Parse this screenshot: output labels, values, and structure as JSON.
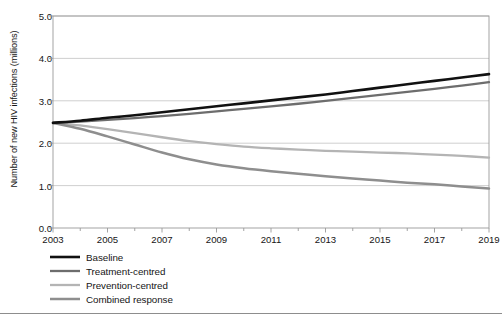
{
  "chart_data": {
    "type": "line",
    "title": "",
    "xlabel": "",
    "ylabel": "Number of new HIV infections (millions)",
    "xlim": [
      2003,
      2019
    ],
    "ylim": [
      0.0,
      5.0
    ],
    "grid": true,
    "legend_position": "below-axes-left",
    "x": [
      2003,
      2004,
      2005,
      2006,
      2007,
      2008,
      2009,
      2010,
      2011,
      2012,
      2013,
      2014,
      2015,
      2016,
      2017,
      2018,
      2019
    ],
    "ytick_labels": [
      "0.0",
      "1.0",
      "2.0",
      "3.0",
      "4.0",
      "5.0"
    ],
    "ytick_values": [
      0.0,
      1.0,
      2.0,
      3.0,
      4.0,
      5.0
    ],
    "xtick_labels": [
      "2003",
      "2005",
      "2007",
      "2009",
      "2011",
      "2013",
      "2015",
      "2017",
      "2019"
    ],
    "xtick_values": [
      2003,
      2005,
      2007,
      2009,
      2011,
      2013,
      2015,
      2017,
      2019
    ],
    "minor_xticks": [
      2004,
      2006,
      2008,
      2010,
      2012,
      2014,
      2016,
      2018
    ],
    "series": [
      {
        "name": "Baseline",
        "color": "#111111",
        "width": 2.6,
        "values": [
          2.48,
          2.53,
          2.6,
          2.66,
          2.73,
          2.8,
          2.87,
          2.94,
          3.01,
          3.08,
          3.15,
          3.23,
          3.31,
          3.39,
          3.47,
          3.55,
          3.63
        ]
      },
      {
        "name": "Treatment-centred",
        "color": "#6d6d6d",
        "width": 2.3,
        "values": [
          2.48,
          2.51,
          2.55,
          2.59,
          2.64,
          2.69,
          2.75,
          2.81,
          2.87,
          2.93,
          3.0,
          3.07,
          3.14,
          3.21,
          3.28,
          3.36,
          3.44
        ]
      },
      {
        "name": "Prevention-centred",
        "color": "#b4b4b4",
        "width": 2.3,
        "values": [
          2.48,
          2.42,
          2.33,
          2.24,
          2.14,
          2.05,
          1.98,
          1.92,
          1.88,
          1.85,
          1.82,
          1.8,
          1.78,
          1.76,
          1.73,
          1.7,
          1.66
        ]
      },
      {
        "name": "Combined response",
        "color": "#8e8e8e",
        "width": 2.5,
        "values": [
          2.48,
          2.34,
          2.16,
          1.97,
          1.78,
          1.62,
          1.5,
          1.41,
          1.34,
          1.28,
          1.22,
          1.17,
          1.12,
          1.07,
          1.03,
          0.98,
          0.93
        ]
      }
    ]
  },
  "axes": {
    "frame_color": "#9a9a9a",
    "grid_color": "#c9c9c9"
  },
  "footer": {
    "note": ""
  }
}
